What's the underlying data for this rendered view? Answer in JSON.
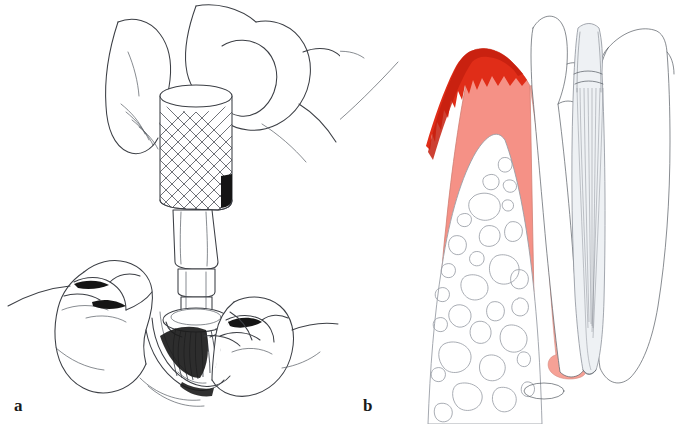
{
  "figure": {
    "type": "two-panel medical illustration",
    "background_color": "#ffffff"
  },
  "panels": [
    {
      "id": "a",
      "label": "a",
      "caption_letter": "a",
      "description": "Line drawing: gloved fingers holding a knurled dental handpiece with a rotary brush tip cleaning an occlusal cavity between two molars",
      "style": "black and white pen line art",
      "elements": [
        "thumb",
        "index-finger",
        "handpiece-knurled-grip",
        "handpiece-neck",
        "handpiece-shaft",
        "brush-tip",
        "left-molar",
        "right-molar",
        "prepared-cavity",
        "gingiva-outline"
      ]
    },
    {
      "id": "b",
      "label": "b",
      "caption_letter": "b",
      "description": "Coloured cross-section through gingiva, alveolar bone and a tooth root showing inflamed gingival margin, periodontal ligament and apical lesion",
      "style": "coloured anatomical cross-section",
      "elements": [
        "inflamed-gingival-margin",
        "gingiva",
        "alveolar-bone-trabeculae",
        "tooth-crown-left",
        "tooth-crown-right",
        "root-canal",
        "periodontal-ligament",
        "apical-lesion",
        "marrow-space"
      ]
    }
  ],
  "colors": {
    "line": "#3c3f45",
    "line_light": "#6b7079",
    "gingiva_fill": "#f59186",
    "gingiva_inflamed": "#e02d18",
    "gingiva_inflamed_dark": "#c4200f",
    "bone_outline": "#8d9199",
    "shadow_black": "#151515",
    "pdl_pink": "#f8a79c",
    "apical_lesion": "#f6a196",
    "canal_grey": "#c9ced6",
    "background": "#ffffff",
    "label_text": "#1a1a1a"
  }
}
